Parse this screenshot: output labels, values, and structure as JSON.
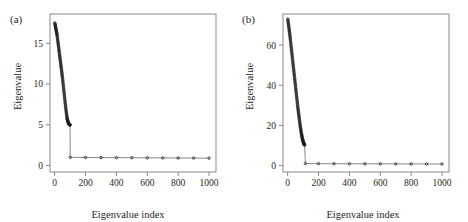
{
  "figure": {
    "width": 468,
    "height": 222,
    "background": "#ffffff",
    "panels": [
      "a",
      "b"
    ]
  },
  "panel_a": {
    "tag": "(a)",
    "xlabel": "Eigenvalue index",
    "ylabel": "Eigenvalue"
  },
  "panel_b": {
    "tag": "(b)",
    "xlabel": "Eigenvalue index",
    "ylabel": "Eigenvalue"
  },
  "chart_data": [
    {
      "type": "scatter",
      "panel": "a",
      "title": "(a)",
      "xlabel": "Eigenvalue index",
      "ylabel": "Eigenvalue",
      "xlim": [
        -30,
        1045
      ],
      "ylim": [
        -0.8,
        18.6
      ],
      "xticks": [
        0,
        200,
        400,
        600,
        800,
        1000
      ],
      "xticklabels": [
        "0",
        "200",
        "400",
        "600",
        "800",
        "1000"
      ],
      "yticks": [
        0,
        5,
        10,
        15
      ],
      "yticklabels": [
        "0",
        "5",
        "10",
        "15"
      ],
      "grid": false,
      "legend": null,
      "marker": "open-circle",
      "marker_color": "#1a1a1a",
      "line_color": "#555555",
      "description": "Scree plot: ~100 eigenvalues descend steeply from about 17.5 to 5, then drop sharply to about 1 and remain flat out to index 1000.",
      "x": [
        1,
        2,
        3,
        4,
        5,
        6,
        7,
        8,
        9,
        10,
        11,
        12,
        13,
        14,
        15,
        16,
        17,
        18,
        19,
        20,
        21,
        22,
        23,
        24,
        25,
        26,
        27,
        28,
        29,
        30,
        31,
        32,
        33,
        34,
        35,
        36,
        37,
        38,
        39,
        40,
        41,
        42,
        43,
        44,
        45,
        46,
        47,
        48,
        49,
        50,
        51,
        52,
        53,
        54,
        55,
        56,
        57,
        58,
        59,
        60,
        61,
        62,
        63,
        64,
        65,
        66,
        67,
        68,
        69,
        70,
        71,
        72,
        73,
        74,
        75,
        76,
        77,
        78,
        79,
        80,
        81,
        82,
        83,
        84,
        85,
        86,
        87,
        88,
        89,
        90,
        91,
        92,
        93,
        94,
        95,
        96,
        97,
        98,
        99,
        100,
        101,
        200,
        300,
        400,
        500,
        600,
        700,
        800,
        900,
        1000
      ],
      "y": [
        17.5,
        17.4,
        17.3,
        17.2,
        17.1,
        17.0,
        16.9,
        16.8,
        16.7,
        16.6,
        16.5,
        16.4,
        16.3,
        16.2,
        16.1,
        16.0,
        15.85,
        15.7,
        15.55,
        15.4,
        15.25,
        15.1,
        14.95,
        14.8,
        14.65,
        14.5,
        14.35,
        14.2,
        14.05,
        13.9,
        13.75,
        13.6,
        13.45,
        13.3,
        13.15,
        13.0,
        12.85,
        12.7,
        12.55,
        12.4,
        12.25,
        12.1,
        11.95,
        11.8,
        11.65,
        11.5,
        11.35,
        11.2,
        11.05,
        10.9,
        10.72,
        10.55,
        10.38,
        10.2,
        10.02,
        9.85,
        9.68,
        9.5,
        9.32,
        9.15,
        8.98,
        8.8,
        8.62,
        8.45,
        8.28,
        8.1,
        7.92,
        7.75,
        7.58,
        7.4,
        7.24,
        7.08,
        6.92,
        6.76,
        6.6,
        6.46,
        6.32,
        6.18,
        6.04,
        5.9,
        5.8,
        5.7,
        5.62,
        5.55,
        5.48,
        5.42,
        5.36,
        5.3,
        5.25,
        5.2,
        5.16,
        5.12,
        5.09,
        5.06,
        5.04,
        5.02,
        5.01,
        5.0,
        4.99,
        4.98,
        1.0,
        0.98,
        0.97,
        0.96,
        0.95,
        0.94,
        0.93,
        0.92,
        0.91,
        0.9
      ]
    },
    {
      "type": "scatter",
      "panel": "b",
      "title": "(b)",
      "xlabel": "Eigenvalue index",
      "ylabel": "Eigenvalue",
      "xlim": [
        -30,
        1045
      ],
      "ylim": [
        -3.2,
        75.5
      ],
      "xticks": [
        0,
        200,
        400,
        600,
        800,
        1000
      ],
      "xticklabels": [
        "0",
        "200",
        "400",
        "600",
        "800",
        "1000"
      ],
      "yticks": [
        0,
        20,
        40,
        60
      ],
      "yticklabels": [
        "0",
        "20",
        "40",
        "60"
      ],
      "grid": false,
      "legend": null,
      "marker": "open-circle",
      "marker_color": "#1a1a1a",
      "line_color": "#555555",
      "description": "Scree plot: ~110 eigenvalues descend steeply from about 73 to 10, then a separated point near 1 at index ~115 with a flat line extending to index 1000.",
      "x": [
        1,
        2,
        3,
        4,
        5,
        6,
        7,
        8,
        9,
        10,
        11,
        12,
        13,
        14,
        15,
        16,
        17,
        18,
        19,
        20,
        21,
        22,
        23,
        24,
        25,
        26,
        27,
        28,
        29,
        30,
        31,
        32,
        33,
        34,
        35,
        36,
        37,
        38,
        39,
        40,
        41,
        42,
        43,
        44,
        45,
        46,
        47,
        48,
        49,
        50,
        51,
        52,
        53,
        54,
        55,
        56,
        57,
        58,
        59,
        60,
        61,
        62,
        63,
        64,
        65,
        66,
        67,
        68,
        69,
        70,
        71,
        72,
        73,
        74,
        75,
        76,
        77,
        78,
        79,
        80,
        81,
        82,
        83,
        84,
        85,
        86,
        87,
        88,
        89,
        90,
        91,
        92,
        93,
        94,
        95,
        96,
        97,
        98,
        99,
        100,
        101,
        102,
        103,
        104,
        105,
        106,
        107,
        108,
        109,
        110,
        115,
        200,
        300,
        400,
        500,
        600,
        700,
        800,
        900,
        1000
      ],
      "y": [
        73.0,
        72.4,
        71.8,
        71.2,
        70.6,
        70.0,
        69.4,
        68.8,
        68.2,
        67.6,
        67.0,
        66.4,
        65.8,
        65.2,
        64.6,
        64.0,
        63.3,
        62.6,
        61.9,
        61.2,
        60.5,
        59.8,
        59.1,
        58.4,
        57.7,
        57.0,
        56.3,
        55.6,
        54.9,
        54.2,
        53.5,
        52.8,
        52.1,
        51.4,
        50.7,
        50.0,
        49.3,
        48.6,
        47.9,
        47.2,
        46.5,
        45.8,
        45.1,
        44.4,
        43.7,
        43.0,
        42.3,
        41.6,
        40.9,
        40.2,
        39.5,
        38.8,
        38.1,
        37.4,
        36.7,
        36.0,
        35.3,
        34.6,
        33.9,
        33.2,
        32.5,
        31.8,
        31.1,
        30.4,
        29.7,
        29.0,
        28.4,
        27.8,
        27.2,
        26.6,
        26.0,
        25.4,
        24.8,
        24.2,
        23.6,
        23.0,
        22.4,
        21.8,
        21.2,
        20.6,
        20.0,
        19.5,
        19.0,
        18.5,
        18.0,
        17.5,
        17.0,
        16.5,
        16.0,
        15.6,
        15.2,
        14.8,
        14.4,
        14.0,
        13.6,
        13.3,
        13.0,
        12.7,
        12.4,
        12.1,
        11.8,
        11.6,
        11.4,
        11.2,
        11.0,
        10.8,
        10.6,
        10.45,
        10.3,
        10.2,
        1.0,
        0.95,
        0.92,
        0.9,
        0.88,
        0.86,
        0.84,
        0.82,
        0.8,
        0.78
      ]
    }
  ]
}
